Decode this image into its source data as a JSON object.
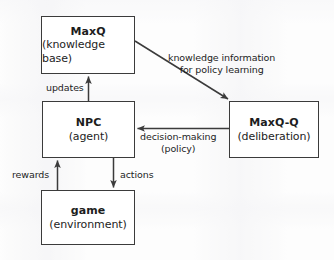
{
  "diagram": {
    "background_color": "#fdfdfd",
    "stroke_color": "#3b3b3b",
    "text_color": "#1d1d1d",
    "nodes": [
      {
        "id": "maxq",
        "title": "MaxQ",
        "subtitle": "(knowledge base)"
      },
      {
        "id": "npc",
        "title": "NPC",
        "subtitle": "(agent)"
      },
      {
        "id": "game",
        "title": "game",
        "subtitle": "(environment)"
      },
      {
        "id": "maxqq",
        "title": "MaxQ-Q",
        "subtitle": "(deliberation)"
      }
    ],
    "edges": [
      {
        "id": "updates",
        "from": "npc",
        "to": "maxq",
        "label_line1": "updates",
        "label_line2": ""
      },
      {
        "id": "knowledge",
        "from": "maxq",
        "to": "maxqq",
        "label_line1": "knowledge information",
        "label_line2": "for policy learning"
      },
      {
        "id": "decision",
        "from": "maxqq",
        "to": "npc",
        "label_line1": "decision-making",
        "label_line2": "(policy)"
      },
      {
        "id": "actions",
        "from": "npc",
        "to": "game",
        "label_line1": "actions",
        "label_line2": ""
      },
      {
        "id": "rewards",
        "from": "game",
        "to": "npc",
        "label_line1": "rewards",
        "label_line2": ""
      }
    ]
  }
}
